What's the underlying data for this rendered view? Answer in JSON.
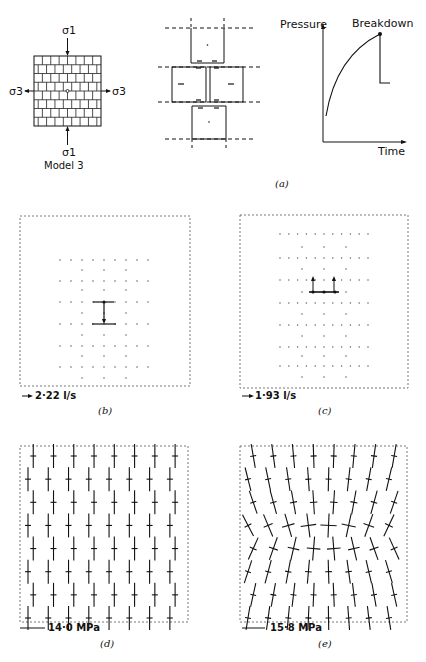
{
  "figure": {
    "panel_a": {
      "label": "(a)",
      "model": {
        "title": "Model 3",
        "sigma1_top": "σ1",
        "sigma1_bottom": "σ1",
        "sigma3_left": "σ3",
        "sigma3_right": "σ3",
        "grid_rows": 8,
        "grid_cols": 8
      },
      "blocks_diagram": {
        "description": "Four blocks around central injection point with shear/normal arrows"
      },
      "pressure_plot": {
        "ylabel": "Pressure",
        "xlabel": "Time",
        "annotation": "Breakdown"
      }
    },
    "panel_b": {
      "label": "(b)",
      "scale": "2·22 l/s"
    },
    "panel_c": {
      "label": "(c)",
      "scale": "1·93 l/s"
    },
    "panel_d": {
      "label": "(d)",
      "scale": "14·0 MPa"
    },
    "panel_e": {
      "label": "(e)",
      "scale": "15·8 MPa"
    }
  },
  "chart_data": {
    "type": "line",
    "title": "",
    "xlabel": "Time",
    "ylabel": "Pressure",
    "annotations": [
      "Breakdown"
    ],
    "series": [
      {
        "name": "pressure",
        "x": [
          0,
          0.1,
          0.2,
          0.35,
          0.5,
          0.65,
          0.8,
          0.8,
          0.92
        ],
        "values": [
          0.2,
          0.45,
          0.6,
          0.74,
          0.84,
          0.9,
          0.94,
          0.45,
          0.45
        ]
      }
    ],
    "grid": false
  }
}
